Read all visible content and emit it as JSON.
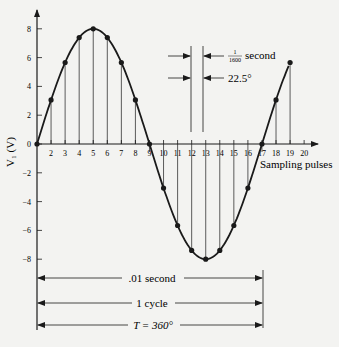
{
  "figure": {
    "y_axis_label": "V₁ (V)",
    "x_axis_label": "Sampling pulses",
    "y_ticks": [
      "8",
      "6",
      "4",
      "2",
      "0",
      "−2",
      "−4",
      "−6",
      "−8"
    ],
    "x_ticks": [
      "2",
      "3",
      "4",
      "5",
      "6",
      "7",
      "8",
      "9",
      "10",
      "11",
      "12",
      "13",
      "14",
      "15",
      "16",
      "17",
      "18",
      "19",
      "20"
    ],
    "annotation_interval_time_num": "1",
    "annotation_interval_time_den": "1600",
    "annotation_interval_time_unit": "second",
    "annotation_interval_angle": "22.5°",
    "span_time": ".01 second",
    "span_cycle": "1 cycle",
    "span_period": "T = 360°"
  },
  "colors": {
    "ink": "#1a1a1a",
    "paper": "#f3f3f1"
  },
  "chart_data": {
    "type": "line",
    "title": "",
    "xlabel": "Sampling pulses",
    "ylabel": "V1 (V)",
    "x": [
      1,
      2,
      3,
      4,
      5,
      6,
      7,
      8,
      9,
      10,
      11,
      12,
      13,
      14,
      15,
      16,
      17,
      18,
      19
    ],
    "values": [
      0,
      3.06,
      5.66,
      7.39,
      8,
      7.39,
      5.66,
      3.06,
      0,
      -3.06,
      -5.66,
      -7.39,
      -8,
      -7.39,
      -5.66,
      -3.06,
      0,
      3.06,
      5.66
    ],
    "xlim": [
      1,
      20
    ],
    "ylim": [
      -8,
      8
    ],
    "sample_interval_seconds": 0.000625,
    "sample_interval_degrees": 22.5,
    "period_seconds": 0.01,
    "grid": false
  }
}
